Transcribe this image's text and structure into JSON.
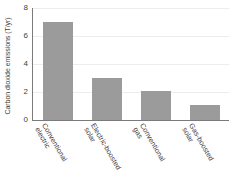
{
  "chart_data": {
    "type": "bar",
    "title": "",
    "xlabel": "",
    "ylabel": "Carbon dioxide emissions (T/yr)",
    "categories": [
      "Conventional electric",
      "Electric-boosted solar",
      "Conventional gas",
      "Gas-boosted solar"
    ],
    "category_lines": [
      [
        "Conventional",
        "electric"
      ],
      [
        "Electric-boosted",
        "solar"
      ],
      [
        "Conventional",
        "gas"
      ],
      [
        "Gas-boosted",
        "solar"
      ]
    ],
    "values": [
      7.0,
      3.0,
      2.1,
      1.1
    ],
    "ylim": [
      0,
      8
    ],
    "yticks": [
      0,
      2,
      4,
      6,
      8
    ],
    "ytick_labels": [
      "0",
      "2",
      "4",
      "6",
      "8"
    ],
    "grid": true,
    "legend": "none",
    "bar_color": "#9b9b9b",
    "gridline_color": "#ededed",
    "axis_color": "#7a7a7a",
    "background_color": "#ffffff"
  }
}
